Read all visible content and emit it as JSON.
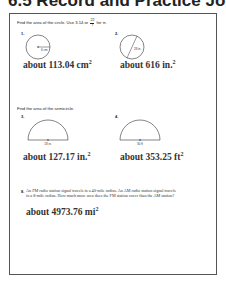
{
  "header": {
    "title": "6.5 Record and Practice Journal"
  },
  "section1": {
    "instruction_prefix": "Find the area of the circle. Use 3.14 or",
    "fraction_num": "22",
    "fraction_den": "7",
    "instruction_suffix": "for π.",
    "problems": [
      {
        "number": "1.",
        "label": "6 cm",
        "answer": "about 113.04 cm",
        "answer_exp": "2"
      },
      {
        "number": "2.",
        "label": "28 in.",
        "answer": "about 616 in.",
        "answer_exp": "2"
      }
    ]
  },
  "section2": {
    "instruction": "Find the area of the semicircle.",
    "problems": [
      {
        "number": "3.",
        "label": "18 in.",
        "answer": "about 127.17 in.",
        "answer_exp": "2"
      },
      {
        "number": "4.",
        "label": "30 ft",
        "answer": "about 353.25 ft",
        "answer_exp": "2"
      }
    ]
  },
  "problem8": {
    "number": "8.",
    "text": "An FM radio station signal travels in a 40-mile radius. An AM radio station signal travels in a 8-mile radius. How much more area does the FM station cover than the AM station?",
    "answer": "about 4973.76 mi",
    "answer_exp": "2"
  }
}
